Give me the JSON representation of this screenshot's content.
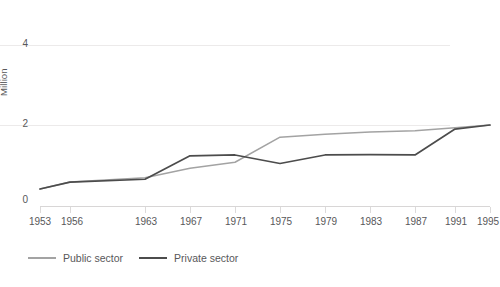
{
  "chart_data": {
    "type": "line",
    "title": "",
    "xlabel": "",
    "ylabel": "Million",
    "x": [
      1953,
      1956,
      1963,
      1967,
      1971,
      1975,
      1979,
      1983,
      1987,
      1991,
      1995
    ],
    "xtick_labels": [
      "1953",
      "1956",
      "1963",
      "1967",
      "1971",
      "1975",
      "1979",
      "1983",
      "1987",
      "1991",
      "1995"
    ],
    "ytick_labels": [
      "0",
      "2",
      "4"
    ],
    "yticks": [
      0,
      2,
      4
    ],
    "ylim": [
      0,
      4.2
    ],
    "grid": "horizontal",
    "legend_position": "bottom-left",
    "series": [
      {
        "name": "Public sector",
        "color": "#a3a3a3",
        "values": [
          0.42,
          0.59,
          0.7,
          0.93,
          1.08,
          1.7,
          1.77,
          1.83,
          1.86,
          1.93,
          2.0
        ]
      },
      {
        "name": "Private sector",
        "color": "#4c4c4c",
        "values": [
          0.42,
          0.59,
          0.66,
          1.24,
          1.26,
          1.05,
          1.26,
          1.27,
          1.26,
          1.9,
          2.0
        ]
      }
    ]
  },
  "legend": {
    "items": [
      {
        "label": "Public sector",
        "swatch": "public-sector-line"
      },
      {
        "label": "Private sector",
        "swatch": "private-sector-line"
      }
    ]
  },
  "colors": {
    "public": "#a3a3a3",
    "private": "#4c4c4c",
    "grid": "#eceaea",
    "axis": "#d8d6d6",
    "text": "#58585a",
    "background": "#ffffff"
  }
}
